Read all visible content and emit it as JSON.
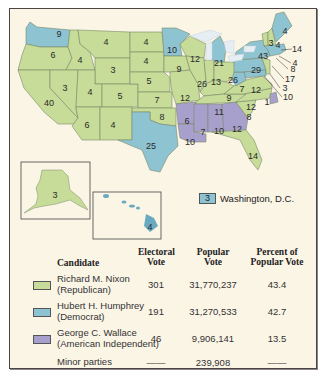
{
  "colors": {
    "republican": "#c6dc98",
    "democrat": "#8ec3d2",
    "american_independent": "#a8a0cc",
    "background": "#fbf5e6",
    "border": "#4a4444",
    "lakes": "#e6eef4"
  },
  "map": {
    "states": [
      {
        "abbr": "WA",
        "ev": "9",
        "party": "democrat"
      },
      {
        "abbr": "OR",
        "ev": "6",
        "party": "republican"
      },
      {
        "abbr": "CA",
        "ev": "40",
        "party": "republican"
      },
      {
        "abbr": "ID",
        "ev": "4",
        "party": "republican"
      },
      {
        "abbr": "NV",
        "ev": "3",
        "party": "republican"
      },
      {
        "abbr": "MT",
        "ev": "4",
        "party": "republican"
      },
      {
        "abbr": "WY",
        "ev": "3",
        "party": "republican"
      },
      {
        "abbr": "UT",
        "ev": "4",
        "party": "republican"
      },
      {
        "abbr": "AZ",
        "ev": "5",
        "party": "republican"
      },
      {
        "abbr": "CO",
        "ev": "6",
        "party": "republican"
      },
      {
        "abbr": "NM",
        "ev": "4",
        "party": "republican"
      },
      {
        "abbr": "ND",
        "ev": "4",
        "party": "republican"
      },
      {
        "abbr": "SD",
        "ev": "4",
        "party": "republican"
      },
      {
        "abbr": "NE",
        "ev": "5",
        "party": "republican"
      },
      {
        "abbr": "KS",
        "ev": "7",
        "party": "republican"
      },
      {
        "abbr": "OK",
        "ev": "8",
        "party": "republican"
      },
      {
        "abbr": "TX",
        "ev": "25",
        "party": "democrat"
      },
      {
        "abbr": "MN",
        "ev": "10",
        "party": "democrat"
      },
      {
        "abbr": "IA",
        "ev": "9",
        "party": "republican"
      },
      {
        "abbr": "MO",
        "ev": "12",
        "party": "republican"
      },
      {
        "abbr": "AR",
        "ev": "6",
        "party": "american_independent"
      },
      {
        "abbr": "LA",
        "ev": "10",
        "party": "american_independent"
      },
      {
        "abbr": "WI",
        "ev": "12",
        "party": "republican"
      },
      {
        "abbr": "IL",
        "ev": "26",
        "party": "republican"
      },
      {
        "abbr": "MI",
        "ev": "21",
        "party": "democrat"
      },
      {
        "abbr": "IN",
        "ev": "13",
        "party": "republican"
      },
      {
        "abbr": "OH",
        "ev": "26",
        "party": "republican"
      },
      {
        "abbr": "KY",
        "ev": "9",
        "party": "republican"
      },
      {
        "abbr": "TN",
        "ev": "11",
        "party": "republican"
      },
      {
        "abbr": "MS",
        "ev": "7",
        "party": "american_independent"
      },
      {
        "abbr": "AL",
        "ev": "10",
        "party": "american_independent"
      },
      {
        "abbr": "GA",
        "ev": "12",
        "party": "american_independent"
      },
      {
        "abbr": "FL",
        "ev": "14",
        "party": "republican"
      },
      {
        "abbr": "SC",
        "ev": "8",
        "party": "republican"
      },
      {
        "abbr": "NC",
        "ev": "12",
        "party": "republican"
      },
      {
        "abbr": "NC-W",
        "ev": "1",
        "party": "american_independent"
      },
      {
        "abbr": "VA",
        "ev": "12",
        "party": "republican"
      },
      {
        "abbr": "WV",
        "ev": "7",
        "party": "democrat"
      },
      {
        "abbr": "PA",
        "ev": "29",
        "party": "democrat"
      },
      {
        "abbr": "NY",
        "ev": "43",
        "party": "democrat"
      },
      {
        "abbr": "VT",
        "ev": "3",
        "party": "republican"
      },
      {
        "abbr": "NH",
        "ev": "4",
        "party": "republican"
      },
      {
        "abbr": "ME",
        "ev": "4",
        "party": "democrat"
      },
      {
        "abbr": "MA",
        "ev": "14",
        "party": "democrat"
      },
      {
        "abbr": "RI",
        "ev": "4",
        "party": "democrat"
      },
      {
        "abbr": "CT",
        "ev": "8",
        "party": "democrat"
      },
      {
        "abbr": "NJ",
        "ev": "17",
        "party": "republican"
      },
      {
        "abbr": "DE",
        "ev": "3",
        "party": "republican"
      },
      {
        "abbr": "MD",
        "ev": "10",
        "party": "democrat"
      },
      {
        "abbr": "AK",
        "ev": "3",
        "party": "republican"
      },
      {
        "abbr": "HI",
        "ev": "4",
        "party": "democrat"
      }
    ],
    "dc_legend": {
      "ev": "3",
      "label": "Washington, D.C."
    }
  },
  "table": {
    "headers": {
      "candidate": "Candidate",
      "electoral_1": "Electoral",
      "electoral_2": "Vote",
      "popular_1": "Popular",
      "popular_2": "Vote",
      "percent_1": "Percent of",
      "percent_2": "Popular Vote"
    },
    "rows": [
      {
        "name": "Richard M. Nixon",
        "party": "(Republican)",
        "electoral": "301",
        "popular": "31,770,237",
        "percent": "43.4"
      },
      {
        "name": "Hubert H. Humphrey",
        "party": "(Democrat)",
        "electoral": "191",
        "popular": "31,270,533",
        "percent": "42.7"
      },
      {
        "name": "George C. Wallace",
        "party": "(American Independent)",
        "electoral": "46",
        "popular": "9,906,141",
        "percent": "13.5"
      },
      {
        "name": "Minor parties",
        "party": "",
        "electoral": "——",
        "popular": "239,908",
        "percent": "——"
      }
    ]
  }
}
